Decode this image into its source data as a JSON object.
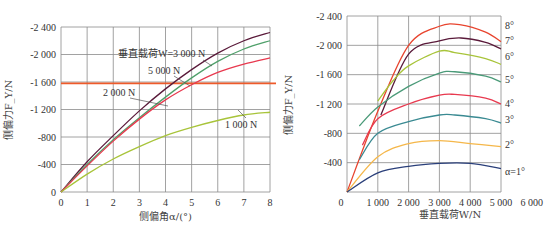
{
  "chart_data": [
    {
      "type": "line",
      "title": "",
      "xlabel": "侧偏角α/(°)",
      "ylabel": "侧偏力F_Y/N",
      "xlim": [
        0,
        8
      ],
      "ylim": [
        0,
        -2400
      ],
      "grid": true,
      "x_ticks": [
        "0",
        "1",
        "2",
        "3",
        "4",
        "5",
        "6",
        "7",
        "8"
      ],
      "y_ticks": [
        "0",
        "-400",
        "-800",
        "-1 200",
        "-1 600",
        "-2 000",
        "-2 400"
      ],
      "x": [
        0,
        1,
        2,
        3,
        4,
        5,
        6,
        7,
        8
      ],
      "series": [
        {
          "name": "垂直载荷W=3 000 N",
          "color": "#5a1a3a",
          "values": [
            0,
            -440,
            -820,
            -1180,
            -1500,
            -1780,
            -2020,
            -2200,
            -2320
          ]
        },
        {
          "name": "5 000 N",
          "color": "#4fa06a",
          "values": [
            0,
            -400,
            -760,
            -1080,
            -1380,
            -1660,
            -1900,
            -2080,
            -2200
          ]
        },
        {
          "name": "2 000 N",
          "color": "#e8394f",
          "values": [
            0,
            -380,
            -740,
            -1060,
            -1340,
            -1560,
            -1740,
            -1860,
            -1950
          ]
        },
        {
          "name": "1 000 N",
          "color": "#a8c43a",
          "values": [
            0,
            -260,
            -480,
            -660,
            -820,
            -940,
            -1040,
            -1120,
            -1160
          ]
        }
      ],
      "reference_line": {
        "y": -1580,
        "color": "#ee5a2a"
      },
      "annotations": [
        "垂直载荷W=3 000 N",
        "5 000 N",
        "2 000 N",
        "1 000 N"
      ]
    },
    {
      "type": "line",
      "title": "",
      "xlabel": "垂直载荷W/N",
      "ylabel": "侧偏力F_Y/N",
      "xlim": [
        0,
        6000
      ],
      "ylim": [
        0,
        -2400
      ],
      "grid": true,
      "x_ticks": [
        "0",
        "1 000",
        "2 000",
        "3 000",
        "4 000",
        "5 000",
        "6 000"
      ],
      "y_ticks": [
        "0",
        "-400",
        "-800",
        "-1 200",
        "-1 600",
        "-2 000",
        "-2 400"
      ],
      "series": [
        {
          "name": "8°",
          "color": "#e8442e",
          "points": [
            [
              0,
              0
            ],
            [
              1000,
              -1100
            ],
            [
              2000,
              -2000
            ],
            [
              3000,
              -2260
            ],
            [
              3700,
              -2280
            ],
            [
              4500,
              -2180
            ],
            [
              5000,
              -2050
            ]
          ]
        },
        {
          "name": "7°",
          "color": "#5a1a3a",
          "points": [
            [
              250,
              -1050
            ],
            [
              1000,
              -1500
            ],
            [
              2000,
              -1880
            ],
            [
              3000,
              -2060
            ],
            [
              3700,
              -2100
            ],
            [
              4500,
              -2040
            ],
            [
              5000,
              -1950
            ]
          ]
        },
        {
          "name": "6°",
          "color": "#a8c43a",
          "points": [
            [
              1000,
              -1240
            ],
            [
              1500,
              -1520
            ],
            [
              2000,
              -1720
            ],
            [
              3000,
              -1920
            ],
            [
              3500,
              -1900
            ],
            [
              4500,
              -1820
            ],
            [
              5000,
              -1740
            ]
          ]
        },
        {
          "name": "5°",
          "color": "#4a9a78",
          "points": [
            [
              -200,
              -900
            ],
            [
              1000,
              -1160
            ],
            [
              2000,
              -1440
            ],
            [
              3000,
              -1620
            ],
            [
              3500,
              -1640
            ],
            [
              4500,
              -1580
            ],
            [
              5000,
              -1500
            ]
          ]
        },
        {
          "name": "4°",
          "color": "#e8394f",
          "points": [
            [
              -500,
              -640
            ],
            [
              1000,
              -1000
            ],
            [
              2000,
              -1200
            ],
            [
              3000,
              -1320
            ],
            [
              3500,
              -1330
            ],
            [
              4500,
              -1280
            ],
            [
              5000,
              -1200
            ]
          ]
        },
        {
          "name": "3°",
          "color": "#3a8a92",
          "points": [
            [
              -700,
              -440
            ],
            [
              1000,
              -800
            ],
            [
              2000,
              -960
            ],
            [
              3000,
              -1050
            ],
            [
              3500,
              -1050
            ],
            [
              4500,
              -1000
            ],
            [
              5000,
              -940
            ]
          ]
        },
        {
          "name": "2°",
          "color": "#f5b74a",
          "points": [
            [
              0,
              0
            ],
            [
              1000,
              -480
            ],
            [
              2000,
              -660
            ],
            [
              3000,
              -700
            ],
            [
              4000,
              -660
            ],
            [
              5000,
              -620
            ]
          ]
        },
        {
          "name": "α=1°",
          "color": "#2a3f7a",
          "points": [
            [
              0,
              0
            ],
            [
              1000,
              -260
            ],
            [
              2000,
              -350
            ],
            [
              3000,
              -390
            ],
            [
              4000,
              -390
            ],
            [
              5000,
              -320
            ]
          ]
        }
      ],
      "annotations": [
        "8°",
        "7°",
        "6°",
        "5°",
        "4°",
        "3°",
        "2°",
        "α=1°"
      ]
    }
  ]
}
